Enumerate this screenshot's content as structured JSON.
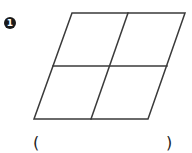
{
  "problem": {
    "number": "1",
    "figure": {
      "shape": "parallelogram divided into 4 equal smaller parallelograms",
      "stroke_color": "#3a3a3a"
    },
    "answer": {
      "open_paren": "(",
      "close_paren": ")",
      "value": ""
    }
  }
}
